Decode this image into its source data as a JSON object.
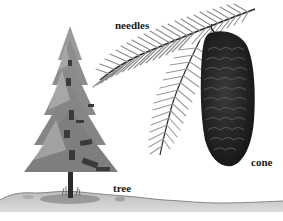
{
  "diagram": {
    "labels": {
      "needles": "needles",
      "cone": "cone",
      "tree": "tree"
    },
    "parts": [
      {
        "id": "tree",
        "label": "tree",
        "description": "small evergreen conifer tree standing on ground"
      },
      {
        "id": "needles",
        "label": "needles",
        "description": "branch sprig with feathery rows of needles"
      },
      {
        "id": "cone",
        "label": "cone",
        "description": "large dark elongated cone with overlapping scales hanging from branch"
      }
    ],
    "colors": {
      "tree_foliage": "#8a8a8a",
      "tree_dark": "#3a3a3a",
      "needles": "#9a9a9a",
      "cone": "#2a2a2a",
      "ground": "#c8c8c8",
      "background": "#ffffff"
    }
  }
}
